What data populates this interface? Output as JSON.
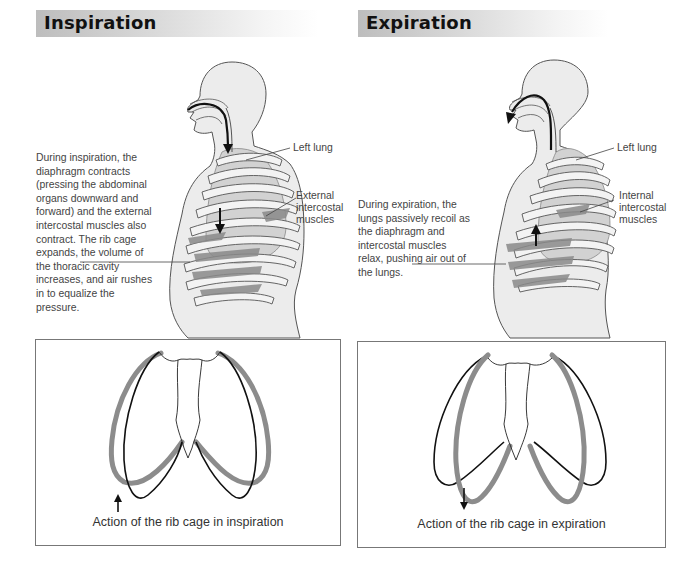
{
  "panels": {
    "inspiration": {
      "title": "Inspiration",
      "description": "During inspiration, the diaphragm contracts (pressing the abdominal organs downward and forward) and the external intercostal muscles also contract. The rib cage expands, the volume of the thoracic cavity increases, and air rushes in to equalize the pressure.",
      "labels": {
        "lung": "Left lung",
        "muscles_1": "External",
        "muscles_2": "intercostal",
        "muscles_3": "muscles"
      },
      "rib_cage_caption": "Action of the rib cage in inspiration",
      "airflow_direction": "in",
      "diaphragm_arrow": "down",
      "rib_arrow": "up"
    },
    "expiration": {
      "title": "Expiration",
      "description": "During expiration, the lungs passively recoil as the diaphragm and intercostal muscles relax, pushing air out of the lungs.",
      "labels": {
        "lung": "Left lung",
        "muscles_1": "Internal",
        "muscles_2": "intercostal",
        "muscles_3": "muscles"
      },
      "rib_cage_caption": "Action of the rib cage in expiration",
      "airflow_direction": "out",
      "diaphragm_arrow": "up",
      "rib_arrow": "down"
    }
  },
  "colors": {
    "title_bar_start": "#bdbdbd",
    "body_fill": "#ececec",
    "lung_fill": "#cfcfcf",
    "muscle_fill": "#8a8a8a",
    "rib_moved": "#8c8c8c",
    "rib_rest": "#111111"
  }
}
